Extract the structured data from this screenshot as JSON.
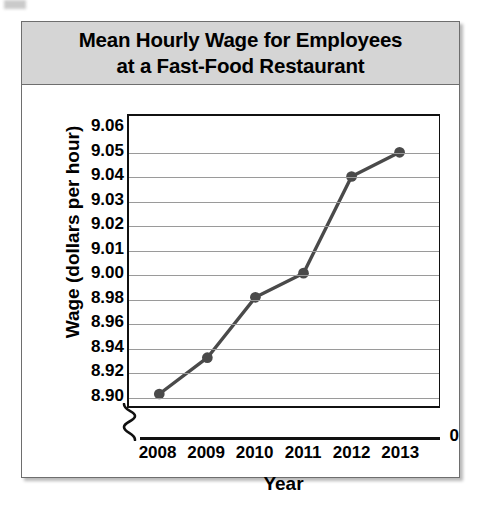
{
  "card": {
    "title_line_1": "Mean Hourly Wage for Employees",
    "title_line_2": "at a Fast-Food Restaurant"
  },
  "chart_data": {
    "type": "line",
    "title": "Mean Hourly Wage for Employees at a Fast-Food Restaurant",
    "xlabel": "Year",
    "ylabel": "Wage (dollars per hour)",
    "categories": [
      "2008",
      "2009",
      "2010",
      "2011",
      "2012",
      "2013"
    ],
    "values": [
      8.9,
      8.93,
      8.98,
      9.0,
      9.04,
      9.05
    ],
    "series": [
      {
        "name": "Mean hourly wage",
        "values": [
          8.9,
          8.93,
          8.98,
          9.0,
          9.04,
          9.05
        ]
      }
    ],
    "points": [
      {
        "x": "2008",
        "y": 8.9
      },
      {
        "x": "2009",
        "y": 8.93
      },
      {
        "x": "2010",
        "y": 8.98
      },
      {
        "x": "2011",
        "y": 9.0
      },
      {
        "x": "2012",
        "y": 9.04
      },
      {
        "x": "2013",
        "y": 9.05
      }
    ],
    "ytick_labels": [
      "9.06",
      "9.05",
      "9.04",
      "9.03",
      "9.02",
      "9.01",
      "9.00",
      "8.98",
      "8.96",
      "8.94",
      "8.92",
      "8.90"
    ],
    "ytick_values": [
      9.06,
      9.05,
      9.04,
      9.03,
      9.02,
      9.01,
      9.0,
      8.98,
      8.96,
      8.94,
      8.92,
      8.9
    ],
    "y_origin_label": "0",
    "axis_break": true,
    "axis_break_note": "y-axis broken between 0 and 8.90; scale is non-uniform (0.01 steps above 9.00, 0.02 steps below)",
    "ylim": [
      8.9,
      9.06
    ],
    "grid": true,
    "legend": "none",
    "marker": "circle",
    "colors": {
      "line": "#4a4a4a",
      "marker": "#4a4a4a",
      "gridline": "#9a9a9a",
      "axis": "#111111",
      "title_band": "#d5d5d5",
      "card_border": "#6e6e6e",
      "background": "#ffffff"
    }
  }
}
